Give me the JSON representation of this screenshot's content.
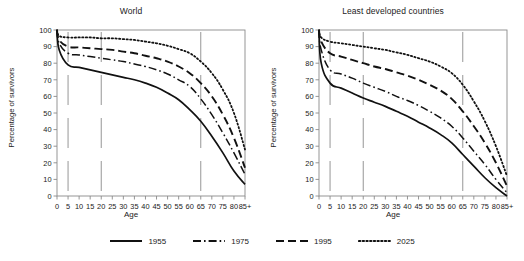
{
  "chart_data": [
    {
      "type": "line",
      "title": "World",
      "xlabel": "Age",
      "ylabel": "Percentage of survivors",
      "xlim": [
        0,
        85
      ],
      "ylim": [
        0,
        100
      ],
      "grid": false,
      "legend_position": "bottom",
      "xtick_labels": [
        "0",
        "5",
        "10",
        "15",
        "20",
        "25",
        "30",
        "35",
        "40",
        "45",
        "50",
        "55",
        "60",
        "65",
        "70",
        "75",
        "80",
        "85+"
      ],
      "xtick_values": [
        0,
        5,
        10,
        15,
        20,
        25,
        30,
        35,
        40,
        45,
        50,
        55,
        60,
        65,
        70,
        75,
        80,
        85
      ],
      "ytick_labels": [
        "0",
        "10",
        "20",
        "30",
        "40",
        "50",
        "60",
        "70",
        "80",
        "90",
        "100"
      ],
      "ytick_values": [
        0,
        10,
        20,
        30,
        40,
        50,
        60,
        70,
        80,
        90,
        100
      ],
      "reference_lines": [
        5,
        20,
        65
      ],
      "x": [
        0,
        1,
        5,
        10,
        15,
        20,
        25,
        30,
        35,
        40,
        45,
        50,
        55,
        60,
        65,
        70,
        75,
        80,
        85
      ],
      "series": [
        {
          "name": "1955",
          "style": "solid",
          "values": [
            100,
            88,
            79,
            77.5,
            76,
            74.5,
            73,
            71.5,
            70,
            68,
            65.5,
            62,
            58,
            52,
            45,
            36,
            26,
            15,
            7
          ]
        },
        {
          "name": "1975",
          "style": "dashdot",
          "values": [
            100,
            92,
            86,
            85,
            84,
            83,
            82,
            81,
            79.5,
            78,
            76,
            73.5,
            70,
            66,
            58.5,
            49,
            38,
            26,
            13
          ]
        },
        {
          "name": "1995",
          "style": "dashed",
          "values": [
            100,
            94,
            90,
            89.5,
            89,
            88.5,
            88,
            87,
            86,
            84.5,
            83,
            81,
            78,
            74,
            68,
            60,
            49,
            35,
            17
          ]
        },
        {
          "name": "2025",
          "style": "dotted",
          "values": [
            100,
            96.5,
            95.5,
            95.5,
            95.5,
            95,
            95,
            94.5,
            94,
            93,
            92,
            90.5,
            88.5,
            86,
            81,
            74,
            64,
            50,
            28
          ]
        }
      ]
    },
    {
      "type": "line",
      "title": "Least developed countries",
      "xlabel": "Age",
      "ylabel": "Percentage of survivors",
      "xlim": [
        0,
        85
      ],
      "ylim": [
        0,
        100
      ],
      "grid": false,
      "legend_position": "bottom",
      "xtick_labels": [
        "0",
        "5",
        "10",
        "15",
        "20",
        "25",
        "30",
        "35",
        "40",
        "45",
        "50",
        "55",
        "60",
        "65",
        "70",
        "75",
        "80",
        "85+"
      ],
      "xtick_values": [
        0,
        5,
        10,
        15,
        20,
        25,
        30,
        35,
        40,
        45,
        50,
        55,
        60,
        65,
        70,
        75,
        80,
        85
      ],
      "ytick_labels": [
        "0",
        "10",
        "20",
        "30",
        "40",
        "50",
        "60",
        "70",
        "80",
        "90",
        "100"
      ],
      "ytick_values": [
        0,
        10,
        20,
        30,
        40,
        50,
        60,
        70,
        80,
        90,
        100
      ],
      "reference_lines": [
        5,
        20,
        65
      ],
      "x": [
        0,
        1,
        5,
        10,
        15,
        20,
        25,
        30,
        35,
        40,
        45,
        50,
        55,
        60,
        65,
        70,
        75,
        80,
        85
      ],
      "series": [
        {
          "name": "1955",
          "style": "solid",
          "values": [
            100,
            80,
            68,
            65,
            62,
            59,
            56.5,
            54,
            51,
            48,
            44.5,
            41,
            37,
            32,
            25,
            18,
            11,
            5,
            0
          ]
        },
        {
          "name": "1975",
          "style": "dashdot",
          "values": [
            100,
            88,
            76,
            73.5,
            71,
            68,
            65.5,
            63,
            60,
            57.5,
            54.5,
            51,
            47,
            42,
            35,
            27,
            19,
            10,
            2
          ]
        },
        {
          "name": "1995",
          "style": "dashed",
          "values": [
            100,
            93,
            86,
            84,
            82,
            80,
            78,
            76.5,
            74.5,
            72.5,
            70,
            67,
            63.5,
            58.5,
            51,
            42,
            32,
            20,
            6
          ]
        },
        {
          "name": "2025",
          "style": "dotted",
          "values": [
            100,
            95.5,
            93,
            92,
            91,
            90,
            89,
            88,
            86.5,
            85,
            83,
            81,
            78,
            74,
            67,
            57,
            45,
            30,
            12
          ]
        }
      ]
    }
  ],
  "legend": {
    "items": [
      {
        "label": "1955",
        "style": "solid"
      },
      {
        "label": "1975",
        "style": "dashdot"
      },
      {
        "label": "1995",
        "style": "dashed"
      },
      {
        "label": "2025",
        "style": "dotted"
      }
    ]
  },
  "colors": {
    "line": "#111111",
    "axis": "#8a8a8a",
    "reference": "#8a8a8a",
    "text": "#1a1a1a",
    "background": "#ffffff"
  }
}
